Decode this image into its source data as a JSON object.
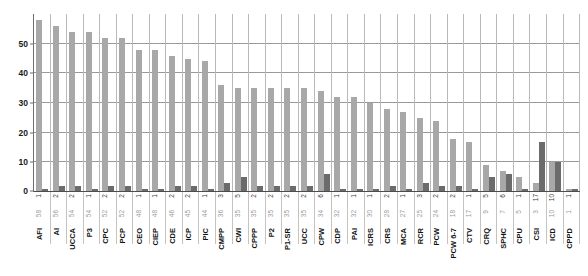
{
  "chart_data": {
    "type": "bar",
    "title": "",
    "subtitle": "",
    "xlabel": "",
    "ylabel": "",
    "ylim": [
      0,
      60
    ],
    "grid": true,
    "legend_position": "none",
    "y_ticks": [
      0,
      10,
      20,
      30,
      40,
      50
    ],
    "y_tick_labels": [
      "0",
      "10",
      "20",
      "30",
      "40",
      "50"
    ],
    "categories": [
      "AFI",
      "AI",
      "UCCA",
      "P3",
      "CPC",
      "PCP",
      "CEO",
      "CIEP",
      "CDE",
      "ICP",
      "PIC",
      "CMPP",
      "CWI",
      "CPPP",
      "P2",
      "P1-SR",
      "UCC",
      "CPW",
      "CDP",
      "PAI",
      "ICRS",
      "CRS",
      "MCA",
      "RCR",
      "PCW",
      "PCW 6-7",
      "CTV",
      "CRQ",
      "SPHC",
      "CPU",
      "CSI",
      "ICD",
      "CPPD"
    ],
    "series": [
      {
        "name": "light",
        "color": "#a8a8a8",
        "values": [
          58,
          56,
          54,
          54,
          52,
          52,
          48,
          48,
          46,
          45,
          44,
          36,
          35,
          35,
          35,
          35,
          35,
          34,
          32,
          32,
          30,
          28,
          27,
          25,
          24,
          18,
          17,
          9,
          7,
          5,
          3,
          10,
          1
        ]
      },
      {
        "name": "dark",
        "color": "#6b6b6b",
        "values": [
          1,
          2,
          2,
          1,
          2,
          2,
          1,
          1,
          2,
          2,
          1,
          3,
          5,
          2,
          2,
          2,
          2,
          6,
          1,
          1,
          1,
          2,
          1,
          3,
          2,
          2,
          1,
          5,
          6,
          1,
          17,
          10,
          1
        ]
      }
    ]
  },
  "axis": {
    "y_title": "",
    "x_title": ""
  }
}
